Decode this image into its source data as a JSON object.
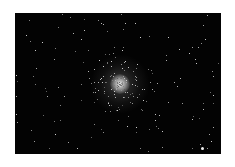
{
  "image": {
    "alt": "Globular star cluster against a black starfield",
    "subject": "globular-cluster",
    "background_color": "#030303",
    "frame_color": "#ffffff",
    "core_color": "#e8e8e8",
    "cluster_center": {
      "x": 105,
      "y": 71
    },
    "bright_star": {
      "x": 187,
      "y": 135
    }
  }
}
